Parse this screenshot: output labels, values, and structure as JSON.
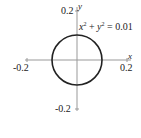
{
  "chart_data": {
    "type": "line",
    "title": "",
    "xlabel": "x",
    "ylabel": "y",
    "xlim": [
      -0.2,
      0.2
    ],
    "ylim": [
      -0.2,
      0.2
    ],
    "x_ticks": [
      "-0.2",
      "0.2"
    ],
    "y_ticks": [
      "0.2",
      "-0.2"
    ],
    "grid": false,
    "annotation": "x² + y² = 0.01",
    "series": [
      {
        "name": "circle",
        "equation": "x^2 + y^2 = 0.01",
        "center": [
          0,
          0
        ],
        "radius": 0.1
      }
    ]
  },
  "colors": {
    "axis": "#999999",
    "curve": "#222222"
  }
}
